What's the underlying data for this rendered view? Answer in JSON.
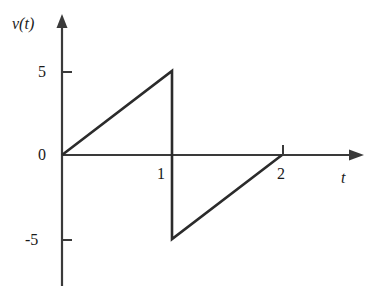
{
  "figure": {
    "background_color": "#ffffff",
    "line_color": "#2b2b2b",
    "axis_color": "#3a3a3a",
    "text_color": "#1a1a1a"
  },
  "axes": {
    "y_axis_label": "v(t)",
    "x_axis_label": "t",
    "y_ticks": [
      {
        "value": 5,
        "label": "5"
      },
      {
        "value": 0,
        "label": "0"
      },
      {
        "value": -5,
        "label": "-5"
      }
    ],
    "x_ticks": [
      {
        "value": 1,
        "label": "1"
      },
      {
        "value": 2,
        "label": "2"
      }
    ]
  },
  "chart_data": {
    "type": "line",
    "title": "",
    "subtitle": "",
    "xlabel": "t",
    "ylabel": "v(t)",
    "xlim": [
      0,
      2.7
    ],
    "ylim": [
      -7,
      7.5
    ],
    "grid": false,
    "legend": null,
    "x_tick_values": [
      1,
      2
    ],
    "x_tick_labels": [
      "1",
      "2"
    ],
    "y_tick_values": [
      5,
      0,
      -5
    ],
    "y_tick_labels": [
      "5",
      "0",
      "-5"
    ],
    "series": [
      {
        "name": "v(t)",
        "color": "#2b2b2b",
        "points": [
          {
            "x": 0,
            "y": 0
          },
          {
            "x": 1,
            "y": 5
          },
          {
            "x": 1,
            "y": -5
          },
          {
            "x": 2,
            "y": 0
          }
        ]
      }
    ]
  }
}
